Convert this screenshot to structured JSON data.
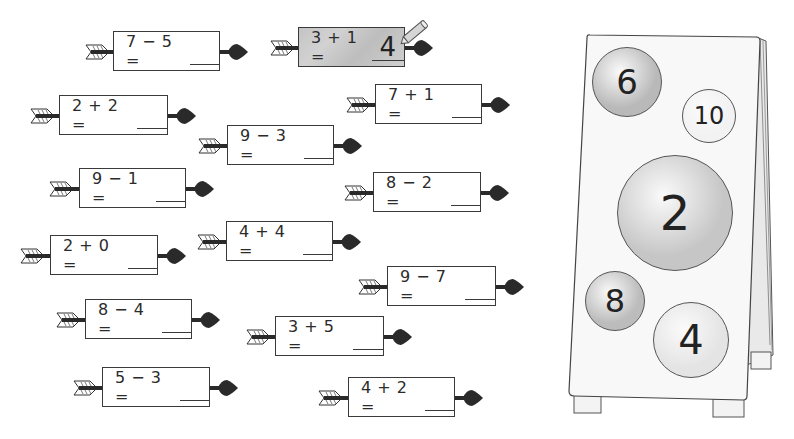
{
  "worksheet": {
    "equations": [
      {
        "id": "eq-7-5",
        "text": "7 − 5 =",
        "answer": "",
        "x": 85,
        "y": 31,
        "box_left": 28,
        "box_width": 107,
        "solved": false
      },
      {
        "id": "eq-3+1",
        "text": "3 + 1 =",
        "answer": "4",
        "x": 270,
        "y": 27,
        "box_left": 28,
        "box_width": 107,
        "solved": true
      },
      {
        "id": "eq-2+2",
        "text": "2 + 2 =",
        "answer": "",
        "x": 30,
        "y": 95,
        "box_left": 29,
        "box_width": 109,
        "solved": false
      },
      {
        "id": "eq-7+1",
        "text": "7 + 1 =",
        "answer": "",
        "x": 346,
        "y": 84,
        "box_left": 29,
        "box_width": 107,
        "solved": false
      },
      {
        "id": "eq-9-3",
        "text": "9 − 3 =",
        "answer": "",
        "x": 198,
        "y": 125,
        "box_left": 29,
        "box_width": 107,
        "solved": false
      },
      {
        "id": "eq-9-1",
        "text": "9 − 1 =",
        "answer": "",
        "x": 49,
        "y": 168,
        "box_left": 30,
        "box_width": 107,
        "solved": false
      },
      {
        "id": "eq-8-2",
        "text": "8 − 2 =",
        "answer": "",
        "x": 344,
        "y": 172,
        "box_left": 29,
        "box_width": 108,
        "solved": false
      },
      {
        "id": "eq-2+0",
        "text": "2 + 0 =",
        "answer": "",
        "x": 20,
        "y": 235,
        "box_left": 30,
        "box_width": 108,
        "solved": false
      },
      {
        "id": "eq-4+4",
        "text": "4 + 4 =",
        "answer": "",
        "x": 197,
        "y": 221,
        "box_left": 29,
        "box_width": 107,
        "solved": false
      },
      {
        "id": "eq-9-7",
        "text": "9 − 7 =",
        "answer": "",
        "x": 358,
        "y": 266,
        "box_left": 29,
        "box_width": 109,
        "solved": false
      },
      {
        "id": "eq-8-4",
        "text": "8 − 4 =",
        "answer": "",
        "x": 56,
        "y": 299,
        "box_left": 29,
        "box_width": 107,
        "solved": false
      },
      {
        "id": "eq-3+5",
        "text": "3 + 5 =",
        "answer": "",
        "x": 246,
        "y": 316,
        "box_left": 29,
        "box_width": 109,
        "solved": false
      },
      {
        "id": "eq-5-3",
        "text": "5 − 3 =",
        "answer": "",
        "x": 73,
        "y": 367,
        "box_left": 29,
        "box_width": 108,
        "solved": false
      },
      {
        "id": "eq-4+2",
        "text": "4 + 2 =",
        "answer": "",
        "x": 318,
        "y": 377,
        "box_left": 30,
        "box_width": 107,
        "solved": false
      }
    ]
  },
  "target_board": {
    "targets": [
      {
        "id": "target-6",
        "label": "6",
        "cx": 67,
        "cy": 57,
        "r": 35,
        "fill": "#b9b9b9",
        "font_size": 34
      },
      {
        "id": "target-10",
        "label": "10",
        "cx": 149,
        "cy": 91,
        "r": 27,
        "fill": "#f2f2f2",
        "font_size": 24
      },
      {
        "id": "target-2",
        "label": "2",
        "cx": 115,
        "cy": 188,
        "r": 58,
        "fill": "#c6c6c6",
        "font_size": 48
      },
      {
        "id": "target-8",
        "label": "8",
        "cx": 55,
        "cy": 276,
        "r": 30,
        "fill": "#bcbcbc",
        "font_size": 32
      },
      {
        "id": "target-4",
        "label": "4",
        "cx": 131,
        "cy": 315,
        "r": 38,
        "fill": "#e4e4e4",
        "font_size": 40
      }
    ]
  },
  "colors": {
    "ink": "#2b2b2b",
    "solved_fill": "#c8c8c8",
    "board_fill": "#f7f7f7"
  }
}
